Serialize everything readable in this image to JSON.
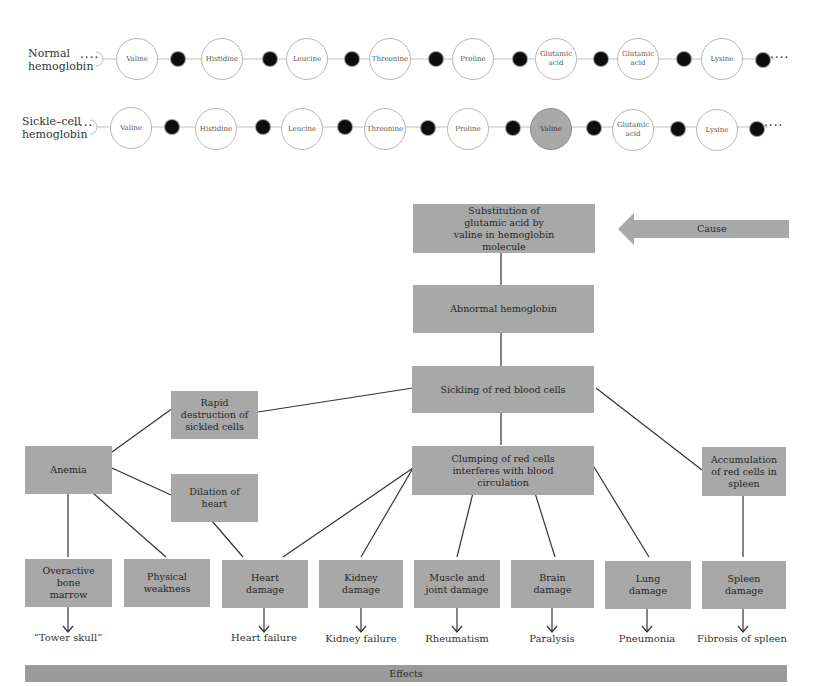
{
  "chains": {
    "normal": {
      "label_line1": "Normal",
      "label_line2": "hemoglobin",
      "amino_acids": [
        {
          "line1": "Valine",
          "line2": ""
        },
        {
          "line1": "Histidine",
          "line2": ""
        },
        {
          "line1": "Leucine",
          "line2": ""
        },
        {
          "line1": "Threonine",
          "line2": ""
        },
        {
          "line1": "Proline",
          "line2": ""
        },
        {
          "line1": "Glutamic",
          "line2": "acid"
        },
        {
          "line1": "Glutamic",
          "line2": "acid"
        },
        {
          "line1": "Lysine",
          "line2": ""
        }
      ],
      "leading_dots": "····",
      "trailing_dots": "····"
    },
    "sickle": {
      "label_line1": "Sickle–cell",
      "label_line2": "hemoglobin",
      "amino_acids": [
        {
          "line1": "Valine",
          "line2": ""
        },
        {
          "line1": "Histidine",
          "line2": ""
        },
        {
          "line1": "Leucine",
          "line2": ""
        },
        {
          "line1": "Threonine",
          "line2": ""
        },
        {
          "line1": "Proline",
          "line2": ""
        },
        {
          "line1": "Valine",
          "line2": "",
          "mutated": true
        },
        {
          "line1": "Glutamic",
          "line2": "acid"
        },
        {
          "line1": "Lysine",
          "line2": ""
        }
      ],
      "leading_dots": "····",
      "trailing_dots": "····"
    }
  },
  "flow": {
    "cause_arrow_label": "Cause",
    "effects_bar_label": "Effects",
    "boxes": {
      "substitution": "Substitution of glutamic acid by valine in hemoglobin molecule",
      "abnormal": "Abnormal hemoglobin",
      "sickling": "Sickling of red blood cells",
      "rapid": "Rapid destruction of sickled cells",
      "clumping": "Clumping of red cells interferes with blood circulation",
      "anemia": "Anemia",
      "dilation": "Dilation of heart",
      "accumulation": "Accumulation of red cells in spleen",
      "bone": "Overactive bone marrow",
      "weakness": "Physical weakness",
      "heart": "Heart damage",
      "kidney": "Kidney damage",
      "muscle": "Muscle and joint damage",
      "brain": "Brain damage",
      "lung": "Lung damage",
      "spleen": "Spleen damage"
    },
    "outcomes": {
      "bone": "“Tower skull”",
      "heart": "Heart failure",
      "kidney": "Kidney failure",
      "muscle": "Rheumatism",
      "brain": "Paralysis",
      "lung": "Pneumonia",
      "spleen": "Fibrosis of spleen"
    }
  },
  "colors": {
    "box_fill": "#a8a8a8",
    "bond_fill": "#0d0d0d",
    "line": "#333333",
    "mutated_residue": "#a9a9a9"
  }
}
